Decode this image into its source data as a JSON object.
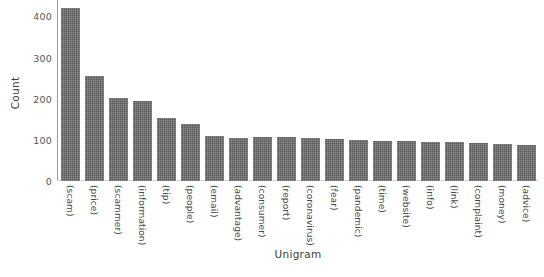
{
  "chart_data": {
    "type": "bar",
    "title": "",
    "xlabel": "Unigram",
    "ylabel": "Count",
    "ylim": [
      0,
      440
    ],
    "yticks": [
      0,
      100,
      200,
      300,
      400
    ],
    "grid": false,
    "legend": null,
    "bar_color": "#585858",
    "background": "#ffffff",
    "categories": [
      "(scam)",
      "(price)",
      "(scammer)",
      "(information)",
      "(tip)",
      "(people)",
      "(email)",
      "(advantage)",
      "(consumer)",
      "(report)",
      "(coronavirus)",
      "(fear)",
      "(pandemic)",
      "(time)",
      "(website)",
      "(info)",
      "(link)",
      "(complaint)",
      "(money)",
      "(advice)"
    ],
    "values": [
      420,
      255,
      202,
      195,
      152,
      138,
      110,
      105,
      106,
      106,
      105,
      103,
      100,
      98,
      97,
      96,
      94,
      92,
      90,
      87
    ]
  }
}
